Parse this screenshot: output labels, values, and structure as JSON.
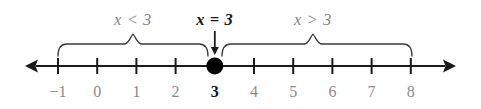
{
  "figure": {
    "name": "number-line-inequality-diagram",
    "width": 481,
    "height": 109,
    "background": "#ffffff"
  },
  "colors": {
    "axis": "#1a1a1a",
    "tick": "#1a1a1a",
    "brace": "#3a3a3a",
    "muted_text": "#848484",
    "emphasis_text": "#101014",
    "point_fill": "#000000"
  },
  "axis": {
    "name": "number-line-axis",
    "y": 66,
    "left_arrow_tip_x": 25,
    "right_arrow_tip_x": 456,
    "tick_spacing": 39.2,
    "origin_x": 58,
    "tick_height": 16,
    "left_arrow_icon": "left-arrow-icon",
    "right_arrow_icon": "right-arrow-icon"
  },
  "ticks": [
    {
      "value": -1,
      "label": "−1",
      "x": 58,
      "emphasis": false
    },
    {
      "value": 0,
      "label": "0",
      "x": 97.2,
      "emphasis": false
    },
    {
      "value": 1,
      "label": "1",
      "x": 136.4,
      "emphasis": false
    },
    {
      "value": 2,
      "label": "2",
      "x": 175.6,
      "emphasis": false
    },
    {
      "value": 3,
      "label": "3",
      "x": 214.8,
      "emphasis": true
    },
    {
      "value": 4,
      "label": "4",
      "x": 254.0,
      "emphasis": false
    },
    {
      "value": 5,
      "label": "5",
      "x": 293.2,
      "emphasis": false
    },
    {
      "value": 6,
      "label": "6",
      "x": 332.4,
      "emphasis": false
    },
    {
      "value": 7,
      "label": "7",
      "x": 371.6,
      "emphasis": false
    },
    {
      "value": 8,
      "label": "8",
      "x": 410.8,
      "emphasis": false
    }
  ],
  "tick_label_y": 83,
  "point": {
    "name": "solid-point-at-3",
    "value": 3,
    "x": 214.8,
    "y": 66,
    "radius": 8.5,
    "filled": true
  },
  "pointer_arrow": {
    "name": "down-arrow-to-point",
    "x": 214.8,
    "y_start": 31,
    "y_end": 55
  },
  "braces": [
    {
      "name": "brace-less-than",
      "left_x": 58,
      "right_x": 208,
      "center_x": 133,
      "top_y": 44,
      "bottom_y": 56
    },
    {
      "name": "brace-greater-than",
      "left_x": 222,
      "right_x": 412,
      "center_x": 313,
      "top_y": 44,
      "bottom_y": 56
    }
  ],
  "region_labels": [
    {
      "name": "label-x-less-than-3",
      "text": "x < 3",
      "x": 133,
      "y": 10,
      "emphasis": false
    },
    {
      "name": "label-x-equals-3",
      "text": "x = 3",
      "x": 214.8,
      "y": 10,
      "emphasis": true
    },
    {
      "name": "label-x-greater-than-3",
      "text": "x > 3",
      "x": 313,
      "y": 10,
      "emphasis": false
    }
  ]
}
